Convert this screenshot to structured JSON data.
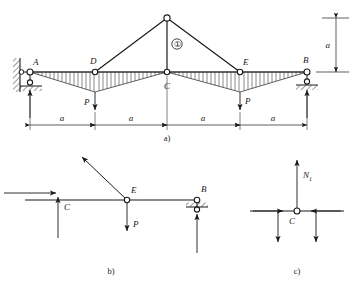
{
  "figure": {
    "stroke_color": "#1a1a1a",
    "hatch_color": "#4a4a4a"
  },
  "panel_a": {
    "caption": "a)",
    "nodes": [
      {
        "id": "A",
        "label": "A",
        "x": 30,
        "y": 72
      },
      {
        "id": "D",
        "label": "D",
        "x": 95,
        "y": 72
      },
      {
        "id": "C",
        "label": "C",
        "x": 167,
        "y": 72
      },
      {
        "id": "E",
        "label": "E",
        "x": 240,
        "y": 72
      },
      {
        "id": "B",
        "label": "B",
        "x": 307,
        "y": 72
      },
      {
        "id": "apex",
        "label": "",
        "x": 167,
        "y": 18
      }
    ],
    "member_label": "①",
    "member_label_x": 176,
    "member_label_y": 44,
    "loads": [
      {
        "label": "P",
        "x": 95,
        "label_side": "left"
      },
      {
        "label": "P",
        "x": 240,
        "label_side": "right"
      }
    ],
    "span_labels": [
      "a",
      "a",
      "a",
      "a"
    ],
    "span_stations": [
      30,
      95,
      167,
      240,
      307
    ],
    "height_label": "a",
    "supports": {
      "left": "pinned-wall",
      "right": "roller-ground"
    }
  },
  "panel_b": {
    "caption": "b)",
    "labels": {
      "C": "C",
      "E": "E",
      "B": "B",
      "P": "P"
    },
    "nodes": [
      {
        "id": "C",
        "x": 58,
        "y": 200
      },
      {
        "id": "E",
        "x": 127,
        "y": 200
      },
      {
        "id": "B",
        "x": 197,
        "y": 200
      }
    ],
    "support_b": "roller-ground"
  },
  "panel_c": {
    "caption": "c)",
    "labels": {
      "C": "C",
      "N1": "N",
      "N1_sub": "1"
    },
    "node": {
      "id": "C",
      "x": 297,
      "y": 211
    }
  }
}
